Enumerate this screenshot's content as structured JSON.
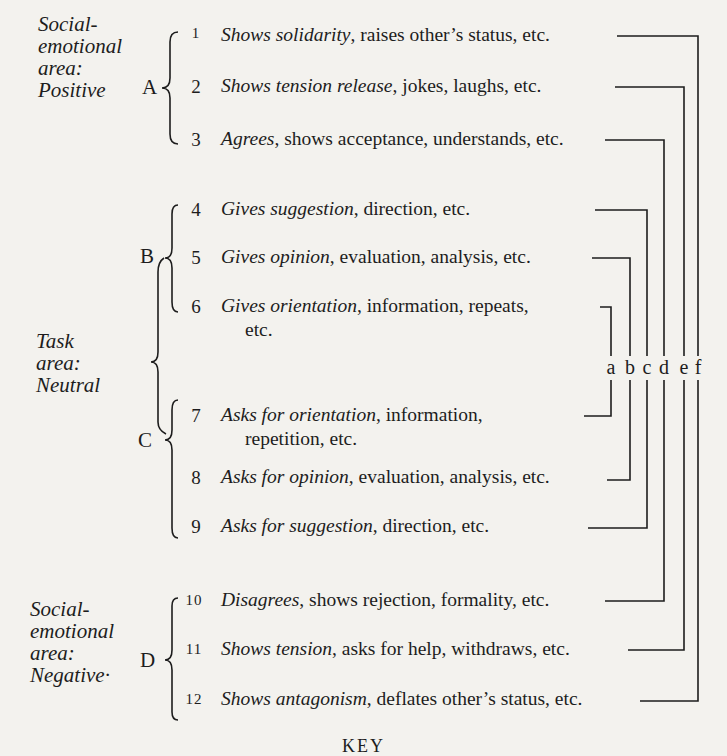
{
  "areas": [
    {
      "id": "positive",
      "lines": [
        "Social-",
        "emotional",
        "area:",
        "Positive"
      ]
    },
    {
      "id": "neutral",
      "lines": [
        "Task",
        "area:",
        "Neutral"
      ]
    },
    {
      "id": "negative",
      "lines": [
        "Social-",
        "emotional",
        "area:",
        "Negative·"
      ]
    }
  ],
  "groups": [
    "A",
    "B",
    "C",
    "D"
  ],
  "categories": [
    {
      "num": "1",
      "key": "Shows solidarity",
      "rest": ", raises other’s status, etc."
    },
    {
      "num": "2",
      "key": "Shows tension release",
      "rest": ", jokes, laughs, etc."
    },
    {
      "num": "3",
      "key": "Agrees",
      "rest": ", shows acceptance, understands, etc."
    },
    {
      "num": "4",
      "key": "Gives suggestion",
      "rest": ", direction, etc."
    },
    {
      "num": "5",
      "key": "Gives opinion",
      "rest": ", evaluation, analysis, etc."
    },
    {
      "num": "6",
      "key": "Gives orientation",
      "rest": ", information, repeats,",
      "cont": "etc."
    },
    {
      "num": "7",
      "key": "Asks for orientation",
      "rest": ", information,",
      "cont": "repetition, etc."
    },
    {
      "num": "8",
      "key": "Asks for opinion",
      "rest": ", evaluation, analysis, etc."
    },
    {
      "num": "9",
      "key": "Asks for suggestion",
      "rest": ", direction, etc."
    },
    {
      "num": "10",
      "key": "Disagrees",
      "rest": ", shows rejection, formality, etc."
    },
    {
      "num": "11",
      "key": "Shows tension",
      "rest": ", asks for help, withdraws, etc."
    },
    {
      "num": "12",
      "key": "Shows antagonism",
      "rest": ", deflates other’s status, etc."
    }
  ],
  "column_letters": [
    "a",
    "b",
    "c",
    "d",
    "e",
    "f"
  ],
  "footer": {
    "text": "KEY"
  }
}
